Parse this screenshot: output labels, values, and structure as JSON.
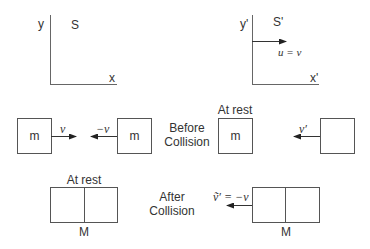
{
  "frames": {
    "s": {
      "y_label": "y",
      "name": "S",
      "x_label": "x"
    },
    "s_prime": {
      "y_label": "y'",
      "name": "S'",
      "x_label": "x'",
      "velocity_label": "u = v"
    }
  },
  "before_collision": {
    "label_line1": "Before",
    "label_line2": "Collision",
    "left_pair": {
      "mass_a": "m",
      "velocity_a": "v",
      "velocity_b": "−v",
      "mass_b": "m"
    },
    "right_pair": {
      "rest_label": "At rest",
      "mass_rest": "m",
      "velocity_moving": "v′",
      "mass_moving": ""
    }
  },
  "after_collision": {
    "label_line1": "After",
    "label_line2": "Collision",
    "left": {
      "rest_label": "At rest",
      "mass": "M"
    },
    "right": {
      "velocity_label": "ṽ′ = −v",
      "mass": "M"
    }
  },
  "colors": {
    "stroke": "#555555",
    "text": "#333333"
  }
}
